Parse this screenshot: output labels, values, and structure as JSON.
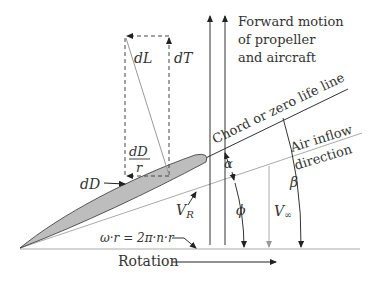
{
  "diagram": {
    "labels": {
      "forward_motion": [
        "Forward motion",
        "of propeller",
        "and aircraft"
      ],
      "chord_line": "Chord or zero life line",
      "air_inflow": [
        "Air inflow",
        "direction"
      ],
      "dL": "dL",
      "dT": "dT",
      "dD_over_r_num": "dD",
      "dD_over_r_den": "r",
      "dD": "dD",
      "VR": "V",
      "VR_sub": "R",
      "alpha": "α",
      "phi": "ϕ",
      "beta": "β",
      "Vinf": "V",
      "Vinf_sub": "∞",
      "omega_r": "ω·r = 2π·n·r",
      "rotation": "Rotation"
    },
    "colors": {
      "blade_fill": "#bdbdbd",
      "line_dark": "#333333",
      "line_light": "#a0a0a0"
    }
  }
}
